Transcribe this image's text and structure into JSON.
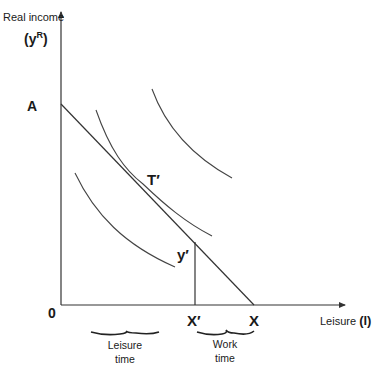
{
  "diagram": {
    "type": "labor-leisure indifference curve diagram",
    "y_axis": {
      "label_line1": "Real income",
      "label_line2_base": "(y",
      "label_line2_sup": "R",
      "label_line2_end": ")"
    },
    "x_axis": {
      "label_text": "Leisure",
      "label_symbol": "(l)"
    },
    "points": {
      "origin": "0",
      "intercept_y": "A",
      "tangency": "T′",
      "income_level": "y′",
      "leisure_chosen": "X′",
      "max_leisure": "X"
    },
    "braces": {
      "leisure": {
        "line1": "Leisure",
        "line2": "time"
      },
      "work": {
        "line1": "Work",
        "line2": "time"
      }
    },
    "indifference_curves": [
      {
        "name": "lower",
        "position": "below budget line"
      },
      {
        "name": "tangent",
        "position": "tangent at T′"
      },
      {
        "name": "upper",
        "position": "above budget line"
      }
    ],
    "budget_line": {
      "from": "A",
      "to": "X"
    }
  }
}
